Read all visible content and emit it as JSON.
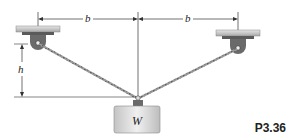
{
  "figure": {
    "number": "P3.36",
    "labels": {
      "left_span": "b",
      "right_span": "b",
      "height": "h",
      "weight": "W"
    },
    "colors": {
      "ceiling_plate": "#c8c8c8",
      "bracket": "#6a6a6a",
      "cable": "#8a8a8a",
      "weight_fill": "#d9d9d9",
      "dimension_line": "#333333"
    }
  }
}
